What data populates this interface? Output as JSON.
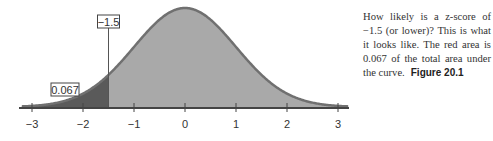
{
  "chart_data": {
    "type": "area",
    "title": "",
    "xlabel": "",
    "ylabel": "",
    "distribution": "standard normal",
    "xlim": [
      -3.2,
      3.2
    ],
    "x_ticks": [
      -3,
      -2,
      -1,
      0,
      1,
      2,
      3
    ],
    "x_tick_labels": [
      "−3",
      "−2",
      "−1",
      "0",
      "1",
      "2",
      "3"
    ],
    "grid": false,
    "shaded_regions": [
      {
        "name": "lower tail",
        "from": -3.2,
        "to": -1.5,
        "color": "#5a5a5a",
        "area": 0.067
      },
      {
        "name": "remainder",
        "from": -1.5,
        "to": 3.2,
        "color": "#a9a9a9"
      }
    ],
    "annotations": [
      {
        "text": "−1.5",
        "x": -1.5,
        "type": "boxed label with vertical line"
      },
      {
        "text": "0.067",
        "x": -2.1,
        "type": "boxed area label"
      }
    ]
  },
  "caption": {
    "text": "How likely is a z-score of −1.5 (or lower)? This is what it looks like. The red area is 0.067 of the total area under the curve.",
    "figure_label": "Figure 20.1"
  },
  "colors": {
    "tail_fill": "#5a5a5a",
    "body_fill": "#a9a9a9",
    "curve_stroke": "#707070",
    "axis": "#444444"
  }
}
